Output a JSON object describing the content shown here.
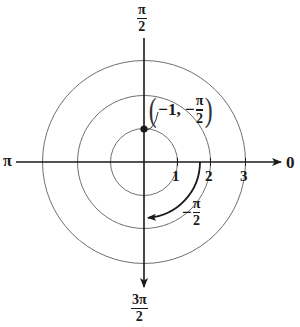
{
  "diagram": {
    "type": "polar-coordinate-plot",
    "origin_px": [
      144,
      162
    ],
    "unit_px": 33.5,
    "circles": [
      {
        "r": 1,
        "label": "1"
      },
      {
        "r": 2,
        "label": "2"
      },
      {
        "r": 3,
        "label": "3"
      }
    ],
    "angle_labels": {
      "zero": "0",
      "pi": "π",
      "half_pi": {
        "num": "π",
        "den": "2"
      },
      "three_half_pi": {
        "num": "3π",
        "den": "2"
      }
    },
    "point": {
      "label_prefix": "−1, −",
      "label_num": "π",
      "label_den": "2",
      "open_paren": "(",
      "close_paren": ")",
      "r": -1,
      "theta": "-π/2",
      "plotted_at": "r = 1 on the π/2 ray"
    },
    "rotation_arc": {
      "label_sign": "−",
      "label_num": "π",
      "label_den": "2",
      "direction": "clockwise",
      "from": "0",
      "to": "-π/2"
    },
    "colors": {
      "ink": "#1a1a1a",
      "circle": "#6f6f6f",
      "background": "#ffffff"
    }
  }
}
